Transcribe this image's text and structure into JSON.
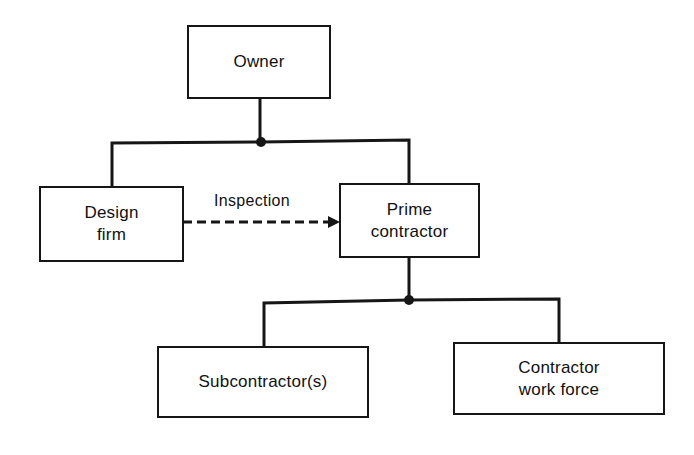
{
  "diagram": {
    "type": "organization-chart",
    "nodes": {
      "owner": {
        "lines": [
          "Owner"
        ]
      },
      "design_firm": {
        "lines": [
          "Design",
          "firm"
        ]
      },
      "prime_contractor": {
        "lines": [
          "Prime",
          "contractor"
        ]
      },
      "subcontractors": {
        "lines": [
          "Subcontractor(s)"
        ]
      },
      "contractor_work_force": {
        "lines": [
          "Contractor",
          "work force"
        ]
      }
    },
    "edges": [
      {
        "from": "owner",
        "to": "design_firm",
        "style": "solid"
      },
      {
        "from": "owner",
        "to": "prime_contractor",
        "style": "solid"
      },
      {
        "from": "design_firm",
        "to": "prime_contractor",
        "style": "dashed-arrow",
        "label": "Inspection"
      },
      {
        "from": "prime_contractor",
        "to": "subcontractors",
        "style": "solid"
      },
      {
        "from": "prime_contractor",
        "to": "contractor_work_force",
        "style": "solid"
      }
    ],
    "labels": {
      "inspection": "Inspection"
    },
    "colors": {
      "line": "#161616",
      "background": "#ffffff"
    }
  }
}
